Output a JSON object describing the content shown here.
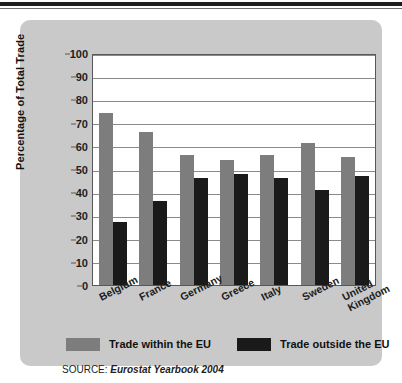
{
  "chart_data": {
    "type": "bar",
    "title": "",
    "xlabel": "",
    "ylabel": "Percentage of Total Trade",
    "ylim": [
      0,
      100
    ],
    "ytick_step": 10,
    "yticks": [
      100,
      90,
      80,
      70,
      60,
      50,
      40,
      30,
      20,
      10,
      0
    ],
    "grid": true,
    "legend_position": "bottom",
    "categories": [
      "Belgium",
      "France",
      "Germany",
      "Greece",
      "Italy",
      "Sweden",
      "United Kingdom"
    ],
    "series": [
      {
        "name": "Trade within the EU",
        "color": "#7d7d7d",
        "values": [
          74,
          66,
          56,
          54,
          56,
          61,
          55
        ]
      },
      {
        "name": "Trade outside the EU",
        "color": "#1a1a1a",
        "values": [
          27,
          36,
          46,
          48,
          46,
          41,
          47
        ]
      }
    ],
    "source_prefix": "SOURCE:",
    "source_reference": "Eurostat Yearbook 2004"
  },
  "colors": {
    "panel": "#c9c9c9",
    "plot_background": "#ffffff",
    "gridline": "#8a8a8a",
    "axis": "#585858",
    "within_eu": "#7d7d7d",
    "outside_eu": "#1a1a1a",
    "text": "#1d1d1d"
  }
}
